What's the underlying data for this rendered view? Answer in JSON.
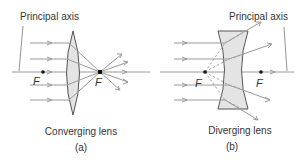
{
  "diagram": {
    "panel_a": {
      "axis_label": "Principal axis",
      "lens_label": "Converging lens",
      "caption": "(a)",
      "focal_left": "F",
      "focal_right": "F"
    },
    "panel_b": {
      "axis_label": "Principal axis",
      "lens_label": "Diverging lens",
      "caption": "(b)",
      "focal_left": "F",
      "focal_right": "F"
    }
  },
  "colors": {
    "ray": "#9a9a9a",
    "lens_fill": "#e4e4e4",
    "lens_stroke": "#555555",
    "text": "#333333",
    "focal_point": "#111111"
  }
}
